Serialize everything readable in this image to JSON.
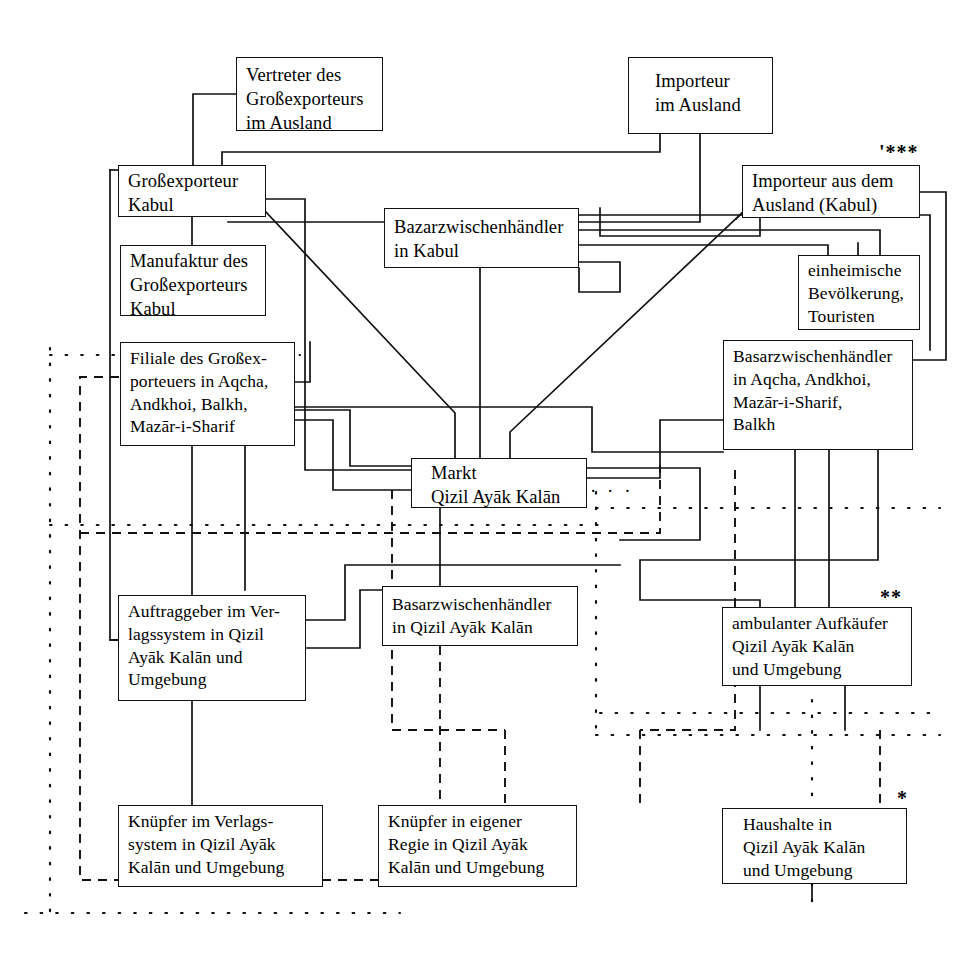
{
  "diagram": {
    "type": "flow-diagram",
    "nodes": [
      {
        "id": "vertreter",
        "lines": [
          "Vertreter des",
          "Großexporteurs",
          "im Ausland"
        ],
        "x": 236,
        "y": 57,
        "w": 147,
        "h": 74
      },
      {
        "id": "importeur-aus",
        "lines": [
          "Importeur",
          "im Ausland"
        ],
        "x": 628,
        "y": 57,
        "w": 145,
        "h": 77
      },
      {
        "id": "grossexporteur",
        "lines": [
          "Großexporteur",
          "Kabul"
        ],
        "x": 118,
        "y": 165,
        "w": 148,
        "h": 52
      },
      {
        "id": "importeur-kabul",
        "lines": [
          "Importeur aus dem",
          "Ausland (Kabul)"
        ],
        "x": 742,
        "y": 165,
        "w": 178,
        "h": 53
      },
      {
        "id": "bazar-kabul",
        "lines": [
          "Bazarzwischenhändler",
          "in Kabul"
        ],
        "x": 384,
        "y": 208,
        "w": 195,
        "h": 60
      },
      {
        "id": "manufaktur",
        "lines": [
          "Manufaktur des",
          "Großexporteurs",
          "Kabul"
        ],
        "x": 120,
        "y": 245,
        "w": 146,
        "h": 71
      },
      {
        "id": "einheimische",
        "lines": [
          "einheimische",
          "Bevölkerung,",
          "Touristen"
        ],
        "x": 798,
        "y": 255,
        "w": 122,
        "h": 75
      },
      {
        "id": "filiale",
        "lines": [
          "Filiale des Großex-",
          "porteuers in Aqcha,",
          "Andkhoi, Balkh,",
          "Mazār-i-Sharif"
        ],
        "x": 120,
        "y": 342,
        "w": 175,
        "h": 104
      },
      {
        "id": "basar-aqcha",
        "lines": [
          "Basarzwischenhändler",
          "in Aqcha, Andkhoi,",
          "Mazār-i-Sharif,",
          "Balkh"
        ],
        "x": 723,
        "y": 340,
        "w": 190,
        "h": 110
      },
      {
        "id": "markt",
        "lines": [
          "Markt",
          "Qizil Ayāk Kalān"
        ],
        "x": 411,
        "y": 458,
        "w": 176,
        "h": 50
      },
      {
        "id": "auftraggeber",
        "lines": [
          "Auftraggeber im Ver-",
          "lagssystem in Qizil",
          "Ayāk Kalān und",
          "Umgebung"
        ],
        "x": 118,
        "y": 595,
        "w": 188,
        "h": 106
      },
      {
        "id": "basar-qizil",
        "lines": [
          "Basarzwischenhändler",
          "in Qizil Ayāk Kalān"
        ],
        "x": 382,
        "y": 586,
        "w": 196,
        "h": 60
      },
      {
        "id": "ambulanter",
        "lines": [
          "ambulanter Aufkäufer",
          "Qizil Ayāk Kalān",
          "und Umgebung"
        ],
        "x": 722,
        "y": 607,
        "w": 190,
        "h": 79
      },
      {
        "id": "knuepfer-verlag",
        "lines": [
          "Knüpfer im Verlags-",
          "system in Qizil Ayāk",
          "Kalān und Umgebung"
        ],
        "x": 118,
        "y": 805,
        "w": 205,
        "h": 82
      },
      {
        "id": "knuepfer-regie",
        "lines": [
          "Knüpfer in eigener",
          "Regie in Qizil Ayāk",
          "Kalān und Umgebung"
        ],
        "x": 378,
        "y": 805,
        "w": 199,
        "h": 82
      },
      {
        "id": "haushalte",
        "lines": [
          "Haushalte in",
          "Qizil Ayāk Kalān",
          "und Umgebung"
        ],
        "x": 722,
        "y": 808,
        "w": 185,
        "h": 76
      }
    ],
    "footnote_marks": [
      {
        "id": "mark-three-stars",
        "text": "'***",
        "x": 879,
        "y": 141
      },
      {
        "id": "mark-two-stars",
        "text": "**",
        "x": 880,
        "y": 586
      },
      {
        "id": "mark-one-star",
        "text": "*",
        "x": 897,
        "y": 787
      }
    ],
    "floating_dots": [
      {
        "id": "dots-markt-right",
        "text": "· · ·",
        "x": 590,
        "y": 489
      }
    ],
    "legend": {
      "solid": "durchgezogene Linie",
      "dashed": "gestrichelte Linie",
      "dotted": "gepunktete Linie"
    },
    "colors": {
      "line": "#111111",
      "background": "#ffffff",
      "text": "#000000"
    }
  }
}
